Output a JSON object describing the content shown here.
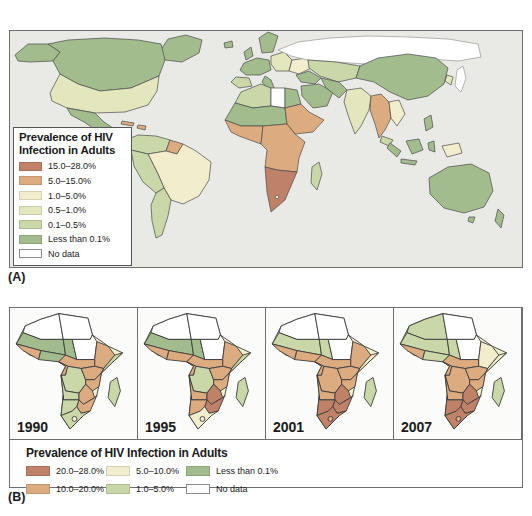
{
  "figure": {
    "subject": "Prevalence of HIV Infection in Adults",
    "panel_a_label": "(A)",
    "panel_b_label": "(B)"
  },
  "palette": {
    "brick": "#c08169",
    "tan": "#dcab80",
    "cream": "#f2eecd",
    "palegreen": "#e4e7bd",
    "lightgreen": "#cad7a9",
    "green": "#a2bc8e",
    "nodata": "#ffffff",
    "ocean": "#e9e9e5"
  },
  "panel_a": {
    "label": "(A)",
    "legend": {
      "title_line1": "Prevalence of HIV",
      "title_line2": "Infection in Adults",
      "items": [
        {
          "range": "15.0–28.0%",
          "color": "brick"
        },
        {
          "range": "5.0–15.0%",
          "color": "tan"
        },
        {
          "range": "1.0–5.0%",
          "color": "cream"
        },
        {
          "range": "0.5–1.0%",
          "color": "palegreen"
        },
        {
          "range": "0.1–0.5%",
          "color": "lightgreen"
        },
        {
          "range": "Less than 0.1%",
          "color": "green"
        },
        {
          "range": "No data",
          "color": "nodata"
        }
      ]
    },
    "regions": {
      "greenland": "green",
      "alaska": "green",
      "canada": "green",
      "usa": "palegreen",
      "mexico": "green",
      "cuba": "tan",
      "hispaniola": "tan",
      "iceland": "green",
      "colombia_venezuela": "lightgreen",
      "guyana": "tan",
      "brazil": "cream",
      "peru_bolivia": "lightgreen",
      "argentina_chile": "lightgreen",
      "scandinavia": "green",
      "uk": "green",
      "west_europe": "green",
      "spain": "lightgreen",
      "italy": "green",
      "east_europe": "palegreen",
      "ukraine": "cream",
      "russia": "nodata",
      "central_asia": "lightgreen",
      "china": "green",
      "korea": "palegreen",
      "japan": "nodata",
      "turkey": "green",
      "middle_east": "green",
      "iran": "green",
      "india": "palegreen",
      "myanmar_thailand": "tan",
      "vietnam": "cream",
      "malaysia": "lightgreen",
      "philippines": "green",
      "sumatra": "green",
      "java": "green",
      "borneo": "green",
      "sulawesi": "green",
      "png": "cream",
      "australia": "green",
      "tasmania": "green",
      "new_zealand": "green",
      "maghreb": "lightgreen",
      "libya": "nodata",
      "egypt": "green",
      "sahel": "green",
      "sudan_ethiopia": "tan",
      "wafrica": "tan",
      "central_africa": "tan",
      "southern_africa": "brick",
      "madagascar_w": "lightgreen",
      "lesotho_w": "cream"
    }
  },
  "panel_b": {
    "label": "(B)",
    "legend": {
      "title": "Prevalence of HIV Infection in Adults",
      "items": [
        {
          "range": "20.0–28.0%",
          "color": "brick"
        },
        {
          "range": "10.0–20.0%",
          "color": "tan"
        },
        {
          "range": "5.0–10.0%",
          "color": "cream"
        },
        {
          "range": "1.0–5.0%",
          "color": "lightgreen"
        },
        {
          "range": "Less than 0.1%",
          "color": "green"
        },
        {
          "range": "No data",
          "color": "nodata"
        }
      ]
    },
    "maps": [
      {
        "year": "1990",
        "regions": {
          "north_w": "nodata",
          "north_e": "nodata",
          "sahel_w": "green",
          "chad": "green",
          "sudan": "nodata",
          "ethiopia": "tan",
          "somalia": "lightgreen",
          "wafrica_w": "tan",
          "wafrica_e": "green",
          "cameroon": "tan",
          "congo": "tan",
          "drc": "lightgreen",
          "uganda_kenya": "tan",
          "tanzania": "tan",
          "angola": "lightgreen",
          "zambia": "tan",
          "zim_moz": "tan",
          "nam_bots": "lightgreen",
          "south_africa": "lightgreen",
          "madagascar": "lightgreen",
          "lesotho": "cream"
        }
      },
      {
        "year": "1995",
        "regions": {
          "north_w": "nodata",
          "north_e": "nodata",
          "sahel_w": "green",
          "chad": "green",
          "sudan": "nodata",
          "ethiopia": "tan",
          "somalia": "lightgreen",
          "wafrica_w": "tan",
          "wafrica_e": "tan",
          "cameroon": "tan",
          "congo": "tan",
          "drc": "lightgreen",
          "uganda_kenya": "tan",
          "tanzania": "tan",
          "angola": "tan",
          "zambia": "brick",
          "zim_moz": "brick",
          "nam_bots": "tan",
          "south_africa": "cream",
          "madagascar": "lightgreen",
          "lesotho": "cream"
        }
      },
      {
        "year": "2001",
        "regions": {
          "north_w": "nodata",
          "north_e": "nodata",
          "sahel_w": "lightgreen",
          "chad": "lightgreen",
          "sudan": "nodata",
          "ethiopia": "tan",
          "somalia": "cream",
          "wafrica_w": "tan",
          "wafrica_e": "tan",
          "cameroon": "tan",
          "congo": "tan",
          "drc": "tan",
          "uganda_kenya": "tan",
          "tanzania": "tan",
          "angola": "tan",
          "zambia": "brick",
          "zim_moz": "brick",
          "nam_bots": "brick",
          "south_africa": "brick",
          "madagascar": "lightgreen",
          "lesotho": "tan"
        }
      },
      {
        "year": "2007",
        "regions": {
          "north_w": "lightgreen",
          "north_e": "nodata",
          "sahel_w": "lightgreen",
          "chad": "lightgreen",
          "sudan": "nodata",
          "ethiopia": "cream",
          "somalia": "cream",
          "wafrica_w": "tan",
          "wafrica_e": "lightgreen",
          "cameroon": "tan",
          "congo": "tan",
          "drc": "tan",
          "uganda_kenya": "tan",
          "tanzania": "tan",
          "angola": "tan",
          "zambia": "brick",
          "zim_moz": "brick",
          "nam_bots": "brick",
          "south_africa": "brick",
          "madagascar": "lightgreen",
          "lesotho": "tan"
        }
      }
    ]
  }
}
